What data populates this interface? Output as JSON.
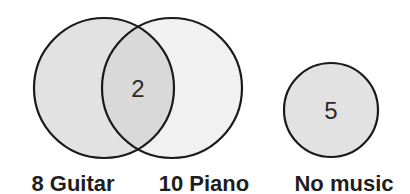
{
  "diagram": {
    "type": "venn",
    "colors": {
      "background": "#ffffff",
      "stroke": "#1a1a1a",
      "guitar_fill": "#e2e2e2",
      "piano_fill": "#f1f1f1",
      "overlap_fill": "#d9d9d9",
      "no_music_fill": "#e2e2e2"
    },
    "sets": [
      {
        "id": "guitar",
        "label": "8 Guitar",
        "count": 8,
        "name": "Guitar"
      },
      {
        "id": "piano",
        "label": "10 Piano",
        "count": 10,
        "name": "Piano"
      },
      {
        "id": "no_music",
        "label": "No music",
        "name": "No music",
        "region_value": "5"
      }
    ],
    "intersection": {
      "sets": [
        "guitar",
        "piano"
      ],
      "value": "2"
    }
  }
}
